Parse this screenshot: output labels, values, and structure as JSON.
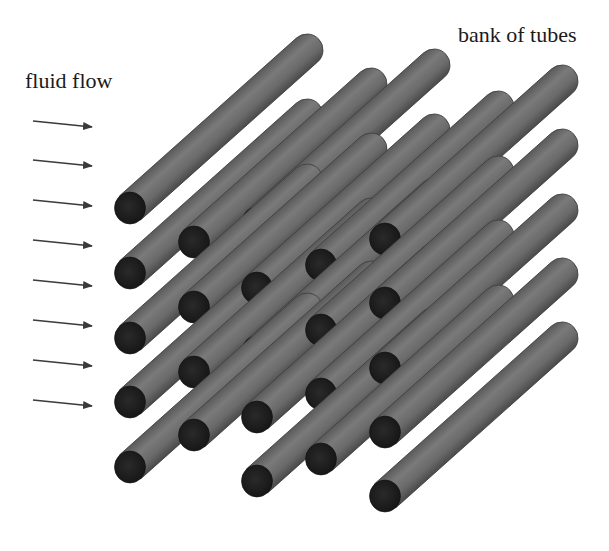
{
  "labels": {
    "fluid_flow": "fluid flow",
    "bank_of_tubes": "bank of tubes"
  },
  "colors": {
    "background": "#ffffff",
    "tube_body": "#6a6a6a",
    "tube_highlight": "#7c7c7c",
    "tube_shadow": "#4e4e4e",
    "tube_end": "#1e1e1e",
    "arrow": "#3a3a3a",
    "text": "#1a1a1a"
  },
  "arrows": {
    "icon": "right-arrow-icon",
    "count": 8,
    "x_start": 33,
    "x_end": 92,
    "y_positions": [
      124,
      163,
      203,
      243,
      283,
      323,
      363,
      403
    ],
    "tilt": 6
  },
  "tube_geometry": {
    "radius": 16,
    "dx": 177,
    "dy": -158
  },
  "tubes": [
    {
      "col": 1,
      "ends": [
        [
          130,
          208
        ],
        [
          130,
          273
        ],
        [
          130,
          338
        ],
        [
          130,
          402
        ],
        [
          130,
          467
        ]
      ]
    },
    {
      "col": 2,
      "ends": [
        [
          194,
          242
        ],
        [
          194,
          307
        ],
        [
          194,
          372
        ],
        [
          194,
          435
        ]
      ]
    },
    {
      "col": 3,
      "ends": [
        [
          257,
          223
        ],
        [
          257,
          288
        ],
        [
          257,
          352
        ],
        [
          257,
          417
        ],
        [
          257,
          481
        ]
      ]
    },
    {
      "col": 4,
      "ends": [
        [
          321,
          265
        ],
        [
          321,
          330
        ],
        [
          321,
          394
        ],
        [
          321,
          459
        ]
      ]
    },
    {
      "col": 5,
      "ends": [
        [
          385,
          239
        ],
        [
          385,
          303
        ],
        [
          385,
          368
        ],
        [
          385,
          432
        ],
        [
          385,
          496
        ]
      ]
    }
  ]
}
